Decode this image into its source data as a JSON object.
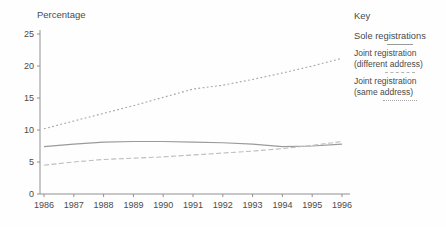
{
  "figure": {
    "y_axis_title": "Percentage",
    "colors": {
      "axis": "#909090",
      "text": "#4a4a4a",
      "sole_line": "#9a9a9a",
      "different_address_line": "#bdbdbd",
      "same_address_line": "#a4a4a4"
    },
    "key": {
      "title": "Key",
      "entries": [
        {
          "style": "solid",
          "label_lines": [
            "Sole registrations"
          ]
        },
        {
          "style": "dashed",
          "label_lines": [
            "Joint registration",
            "(different address)"
          ]
        },
        {
          "style": "dotted",
          "label_lines": [
            "Joint registration",
            "(same address)"
          ]
        }
      ]
    }
  },
  "chart_data": {
    "type": "line",
    "title": "",
    "xlabel": "",
    "ylabel": "Percentage",
    "x": [
      1986,
      1987,
      1988,
      1989,
      1990,
      1991,
      1992,
      1993,
      1994,
      1995,
      1996
    ],
    "ylim": [
      0,
      25
    ],
    "yticks": [
      0,
      5,
      10,
      15,
      20,
      25
    ],
    "grid": false,
    "legend_position": "right",
    "series": [
      {
        "name": "Sole registrations",
        "style": "solid",
        "color": "#9a9a9a",
        "values": [
          7.4,
          7.8,
          8.1,
          8.2,
          8.2,
          8.1,
          8.0,
          7.8,
          7.4,
          7.5,
          7.8
        ]
      },
      {
        "name": "Joint registration (different address)",
        "style": "dashed",
        "color": "#bdbdbd",
        "values": [
          4.5,
          5.0,
          5.4,
          5.6,
          5.8,
          6.1,
          6.4,
          6.7,
          7.1,
          7.6,
          8.2
        ]
      },
      {
        "name": "Joint registration (same address)",
        "style": "dotted",
        "color": "#a4a4a4",
        "values": [
          10.2,
          11.4,
          12.6,
          13.8,
          15.1,
          16.4,
          17.0,
          17.9,
          18.9,
          20.0,
          21.2
        ]
      }
    ]
  }
}
